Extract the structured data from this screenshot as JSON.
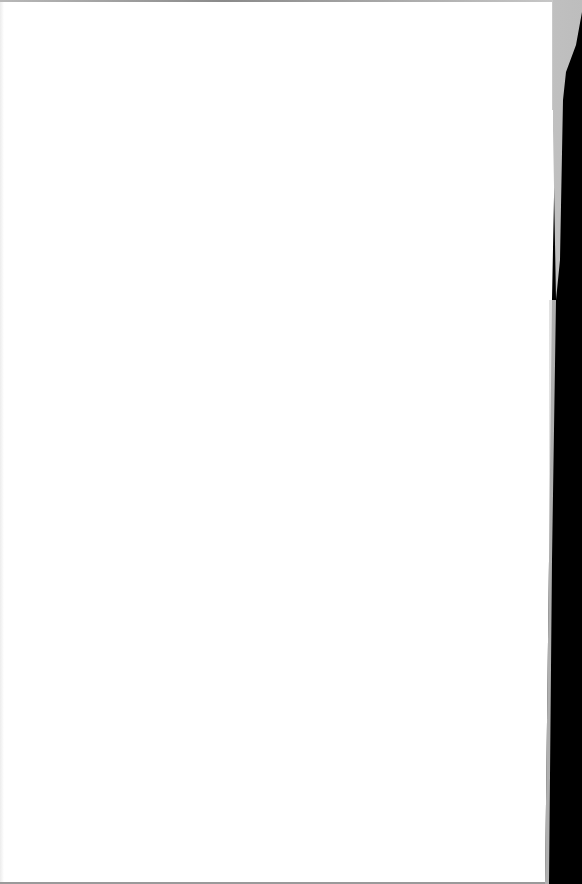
{
  "document": {
    "type": "scanned-page",
    "content": "",
    "state": "blank",
    "colors": {
      "paper": "#ffffff",
      "background": "#000000",
      "curl": "#d2d2d2",
      "edge": "#9a9a9a"
    }
  }
}
